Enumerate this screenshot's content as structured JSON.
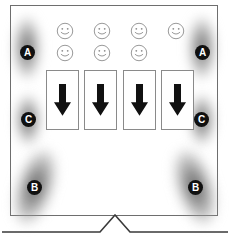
{
  "diagram": {
    "background_color": "#ffffff",
    "outline_color": "#6e6e6e",
    "marker_fill": "#101010",
    "marker_text_color": "#ffffff",
    "blob_color": "#5a5a5a",
    "arrow_color": "#111111",
    "smiley_color": "#8d8d8d"
  },
  "markers": [
    {
      "label": "A",
      "position": "left-upper",
      "x": 20,
      "y": 45
    },
    {
      "label": "A",
      "position": "right-upper",
      "x": 195,
      "y": 45
    },
    {
      "label": "C",
      "position": "left-mid",
      "x": 21,
      "y": 112
    },
    {
      "label": "C",
      "position": "right-mid",
      "x": 194,
      "y": 112
    },
    {
      "label": "B",
      "position": "left-lower",
      "x": 27,
      "y": 180
    },
    {
      "label": "B",
      "position": "right-lower",
      "x": 188,
      "y": 180
    }
  ],
  "blobs": [
    {
      "for": "A",
      "side": "left",
      "x": 14,
      "y": 17,
      "shape": "vertical-ellipse"
    },
    {
      "for": "A",
      "side": "right",
      "x": 189,
      "y": 17,
      "shape": "vertical-ellipse"
    },
    {
      "for": "C",
      "side": "left",
      "x": 16,
      "y": 95,
      "shape": "vertical-ellipse"
    },
    {
      "for": "C",
      "side": "right",
      "x": 190,
      "y": 95,
      "shape": "vertical-ellipse"
    },
    {
      "for": "B",
      "side": "left",
      "x": 17,
      "y": 148,
      "shape": "tilted-ellipse"
    },
    {
      "for": "B",
      "side": "right",
      "x": 177,
      "y": 148,
      "shape": "tilted-ellipse"
    }
  ],
  "smileys": {
    "columns": 4,
    "rows": [
      {
        "row": 0,
        "present": [
          true,
          true,
          true,
          true
        ]
      },
      {
        "row": 1,
        "present": [
          true,
          true,
          true,
          false
        ]
      }
    ],
    "total_count": 7,
    "icon": "smiley-face-icon"
  },
  "arrow_boxes": {
    "count": 4,
    "icon": "down-arrow-icon",
    "direction": "down",
    "items": [
      {
        "index": 1
      },
      {
        "index": 2
      },
      {
        "index": 3
      },
      {
        "index": 4
      }
    ]
  },
  "baseline": {
    "shape": "horizontal-line-with-center-peak",
    "peak_x": 115
  }
}
